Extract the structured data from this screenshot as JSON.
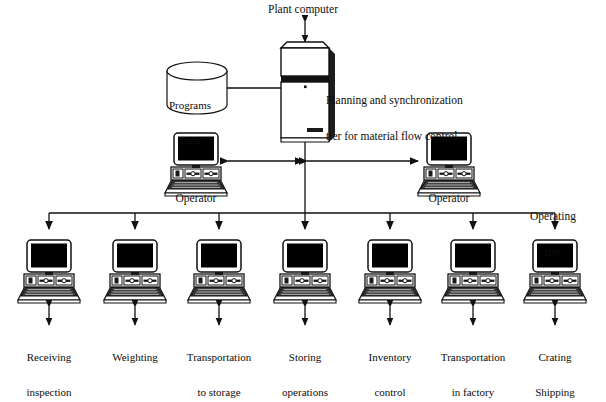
{
  "diagram": {
    "title_top": "Plant computer",
    "tier_label": "Planning and synchronization\ntier for material flow control",
    "tier_label_line1": "Planning and synchronization",
    "tier_label_line2": "tier for material flow control",
    "operating_tier_label": "Operating\ntier",
    "operating_tier_line1": "Operating",
    "operating_tier_line2": "tier",
    "database": {
      "line1": "Programs",
      "line2": "Data",
      "shape": "cylinder-icon"
    },
    "plant_computer": {
      "icon": "tower-computer-icon"
    },
    "operators": [
      {
        "label": "Operator",
        "icon": "desktop-computer-icon",
        "x": 196
      },
      {
        "label": "Operator",
        "icon": "desktop-computer-icon",
        "x": 449
      }
    ],
    "operating_nodes": [
      {
        "label_line1": "Receiving",
        "label_line2": "inspection",
        "icon": "desktop-computer-icon",
        "x": 49
      },
      {
        "label_line1": "Weighting",
        "label_line2": "",
        "icon": "desktop-computer-icon",
        "x": 135
      },
      {
        "label_line1": "Transportation",
        "label_line2": "to storage",
        "icon": "desktop-computer-icon",
        "x": 219
      },
      {
        "label_line1": "Storing",
        "label_line2": "operations",
        "icon": "desktop-computer-icon",
        "x": 305
      },
      {
        "label_line1": "Inventory",
        "label_line2": "control",
        "icon": "desktop-computer-icon",
        "x": 390
      },
      {
        "label_line1": "Transportation",
        "label_line2": "in factory",
        "icon": "desktop-computer-icon",
        "x": 473
      },
      {
        "label_line1": "Crating",
        "label_line2": "Shipping",
        "icon": "desktop-computer-icon",
        "x": 555
      }
    ],
    "colors": {
      "ink": "#111111",
      "background": "#ffffff",
      "screen": "#000000",
      "keyboard": "#2b2b2b"
    }
  }
}
